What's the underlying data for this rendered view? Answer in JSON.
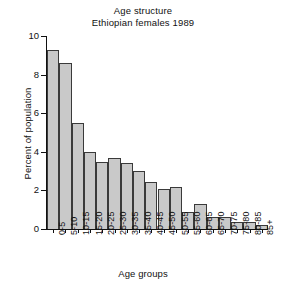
{
  "chart_data": {
    "type": "bar",
    "title": "Age structure\nEthiopian females 1989",
    "title_lines": [
      "Age structure",
      "Ethiopian females 1989"
    ],
    "xlabel": "Age groups",
    "ylabel": "Percent of population",
    "ylim": [
      0,
      10
    ],
    "yticks": [
      0,
      2,
      4,
      6,
      8,
      10
    ],
    "ytick_labels": [
      "0",
      "2",
      "4",
      "6",
      "8",
      "10"
    ],
    "grid": false,
    "legend": null,
    "bar_color": "#c9c9c9",
    "bar_edge_color": "#3a3a3a",
    "axis_color": "#111111",
    "categories": [
      "0-5",
      "5-10",
      "10-15",
      "15-20",
      "20-25",
      "25-30",
      "30-35",
      "35-40",
      "40-45",
      "45-50",
      "50-55",
      "55-60",
      "60-65",
      "65-70",
      "70-75",
      "75-80",
      "80-85",
      "85+"
    ],
    "values": [
      9.3,
      8.6,
      5.5,
      4.0,
      3.45,
      3.7,
      3.4,
      3.0,
      2.45,
      2.05,
      2.2,
      0.9,
      1.3,
      0.6,
      0.6,
      0.35,
      0.35,
      0.2
    ]
  }
}
